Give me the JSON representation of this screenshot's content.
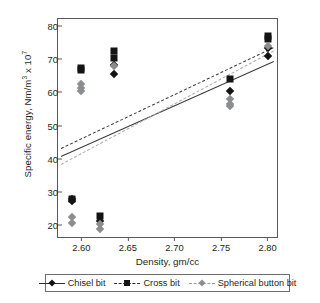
{
  "chart_data": {
    "type": "scatter",
    "title": "",
    "xlabel": "Density, gm/cc",
    "ylabel_html": "Specific energy, Nm/m<sup>3</sup> x 10<sup>7</sup>",
    "ylabel_text": "Specific energy, Nm/m3 x 107",
    "xlim": [
      2.575,
      2.81
    ],
    "ylim": [
      16.5,
      82
    ],
    "xticks": [
      "2.60",
      "2.65",
      "2.70",
      "2.75",
      "2.80"
    ],
    "xtick_values": [
      2.6,
      2.65,
      2.7,
      2.75,
      2.8
    ],
    "yticks": [
      "20",
      "30",
      "40",
      "50",
      "60",
      "70",
      "80"
    ],
    "ytick_values": [
      20,
      30,
      40,
      50,
      60,
      70,
      80
    ],
    "grid": false,
    "legend_position": "below-axes",
    "series": [
      {
        "name": "Chisel bit",
        "marker": "diamond",
        "color": "#141414",
        "line_style": "solid",
        "points": [
          {
            "x": 2.59,
            "y": 27.4
          },
          {
            "x": 2.59,
            "y": 28.0
          },
          {
            "x": 2.62,
            "y": 21.3
          },
          {
            "x": 2.635,
            "y": 65.5
          },
          {
            "x": 2.635,
            "y": 68.3
          },
          {
            "x": 2.76,
            "y": 60.5
          },
          {
            "x": 2.8,
            "y": 71.0
          },
          {
            "x": 2.8,
            "y": 73.4
          }
        ],
        "trend_line": {
          "x1": 2.578,
          "y1": 40.8,
          "x2": 2.806,
          "y2": 69.3
        }
      },
      {
        "name": "Cross bit",
        "marker": "square",
        "color": "#141414",
        "line_style": "dashed",
        "points": [
          {
            "x": 2.59,
            "y": 27.9
          },
          {
            "x": 2.6,
            "y": 66.6
          },
          {
            "x": 2.6,
            "y": 67.2
          },
          {
            "x": 2.62,
            "y": 22.7
          },
          {
            "x": 2.635,
            "y": 72.4
          },
          {
            "x": 2.635,
            "y": 70.3
          },
          {
            "x": 2.76,
            "y": 63.9
          },
          {
            "x": 2.8,
            "y": 76.9
          },
          {
            "x": 2.8,
            "y": 76.0
          }
        ],
        "trend_line": {
          "x1": 2.578,
          "y1": 43.2,
          "x2": 2.806,
          "y2": 73.5
        }
      },
      {
        "name": "Spherical button bit",
        "marker": "diamond-gray",
        "color": "#8b8e90",
        "line_style": "dotted",
        "points": [
          {
            "x": 2.59,
            "y": 22.5
          },
          {
            "x": 2.59,
            "y": 20.7
          },
          {
            "x": 2.6,
            "y": 62.4
          },
          {
            "x": 2.6,
            "y": 61.2
          },
          {
            "x": 2.6,
            "y": 60.3
          },
          {
            "x": 2.62,
            "y": 20.5
          },
          {
            "x": 2.62,
            "y": 19.0
          },
          {
            "x": 2.635,
            "y": 68.0
          },
          {
            "x": 2.76,
            "y": 58.0
          },
          {
            "x": 2.76,
            "y": 56.6
          },
          {
            "x": 2.76,
            "y": 55.9
          },
          {
            "x": 2.8,
            "y": 74.0
          }
        ],
        "trend_line": {
          "x1": 2.578,
          "y1": 38.5,
          "x2": 2.806,
          "y2": 72.6
        }
      }
    ]
  },
  "axes": {
    "xlabel": "Density, gm/cc",
    "xticks": [
      "2.60",
      "2.65",
      "2.70",
      "2.75",
      "2.80"
    ],
    "yticks": [
      "80",
      "70",
      "60",
      "50",
      "40",
      "30",
      "20"
    ]
  },
  "legend": {
    "items": [
      {
        "label": "Chisel bit",
        "marker": "diamond-icon",
        "line": "solid"
      },
      {
        "label": "Cross bit",
        "marker": "square-icon",
        "line": "dashed"
      },
      {
        "label": "Spherical button bit",
        "marker": "diamond-gray-icon",
        "line": "dotted"
      }
    ]
  },
  "colors": {
    "marker_dark": "#141414",
    "marker_gray": "#8b8e90",
    "axis": "#55595c",
    "text": "#231f20"
  }
}
